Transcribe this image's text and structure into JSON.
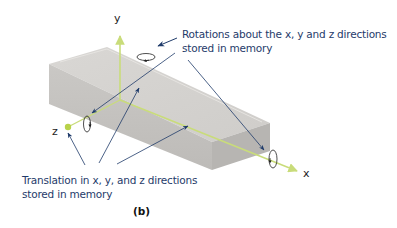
{
  "figure": {
    "label": "(b)",
    "object": "rectangular bar (3D box)"
  },
  "axes": {
    "x_label": "x",
    "y_label": "y",
    "z_label": "z"
  },
  "annotations": {
    "rotations_line1": "Rotations about the x, y and z directions",
    "rotations_line2": "stored in memory",
    "translation_line1": "Translation in x, y, and z directions",
    "translation_line2": "stored in memory"
  },
  "colors": {
    "axis": "#c9dc7a",
    "arrow": "#1f3b6a",
    "text": "#1f3b6a",
    "box_top": "#d6d4d1",
    "box_front": "#c4c2bf",
    "box_end": "#b8b6b3"
  }
}
